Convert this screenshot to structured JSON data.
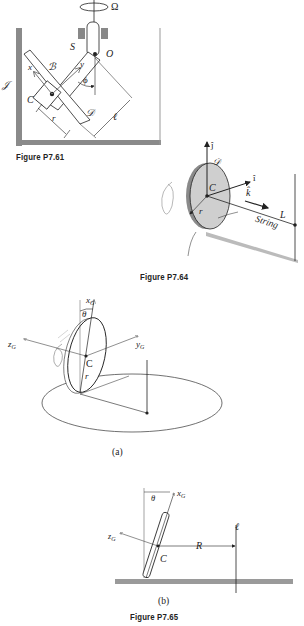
{
  "figures": [
    {
      "caption": "Figure P7.61",
      "labels": {
        "omega": "Ω",
        "S": "S",
        "O": "O",
        "J": "𝒥",
        "x": "x",
        "B": "ℬ",
        "y": "y",
        "phi": "ϕ",
        "C": "C",
        "D": "𝒟",
        "r": "r",
        "l": "ℓ"
      }
    },
    {
      "caption": "Figure P7.64",
      "labels": {
        "j": "ĵ",
        "D": "𝒟",
        "i": "î",
        "C": "C",
        "k": "k̂",
        "r": "r",
        "L": "L",
        "string": "String"
      }
    },
    {
      "caption": "Figure P7.65",
      "parts": [
        {
          "part_label": "(a)",
          "labels": {
            "theta": "θ",
            "xG": "x",
            "zG": "z",
            "yG": "y",
            "G_sub": "G",
            "C": "C",
            "r": "r"
          }
        },
        {
          "part_label": "(b)",
          "labels": {
            "theta": "θ",
            "xG": "x",
            "zG": "z",
            "G_sub": "G",
            "C": "C",
            "R": "R",
            "l": "ℓ"
          }
        }
      ]
    }
  ]
}
